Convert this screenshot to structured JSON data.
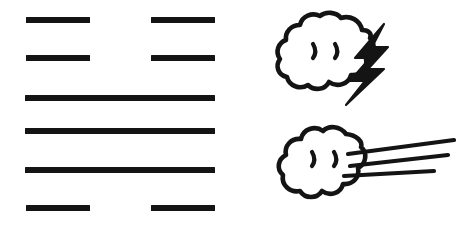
{
  "figure": {
    "background_color": "#ffffff",
    "ink_color": "#141414",
    "caption": "",
    "hexagram": {
      "name": "hexagram",
      "reading_order": "bottom-to-top",
      "line_type_solid": "yang",
      "line_type_broken": "yin",
      "lines_top_to_bottom": [
        {
          "position": 6,
          "type": "yin",
          "label": "broken"
        },
        {
          "position": 5,
          "type": "yin",
          "label": "broken"
        },
        {
          "position": 4,
          "type": "yang",
          "label": "solid"
        },
        {
          "position": 3,
          "type": "yang",
          "label": "solid"
        },
        {
          "position": 2,
          "type": "yang",
          "label": "solid"
        },
        {
          "position": 1,
          "type": "yin",
          "label": "broken"
        }
      ]
    },
    "icons": [
      {
        "name": "thunder-cloud-icon",
        "glyph": "cloud-with-lightning-bolt",
        "label": "",
        "parts": [
          "cloud",
          "two-eyes",
          "lightning-bolt"
        ]
      },
      {
        "name": "wind-cloud-icon",
        "glyph": "cloud-with-wind-lines",
        "label": "",
        "parts": [
          "cloud",
          "two-eyes",
          "three-wind-lines"
        ]
      }
    ]
  }
}
